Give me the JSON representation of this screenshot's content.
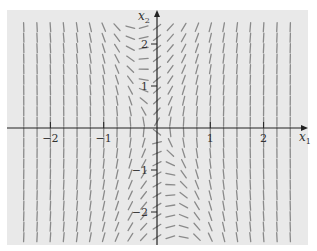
{
  "chart_data": {
    "type": "slope-field",
    "title": "",
    "xlabel": "x1",
    "ylabel": "x2",
    "xlim": [
      -2.85,
      2.8
    ],
    "ylim": [
      -2.8,
      2.8
    ],
    "x_ticks": [
      {
        "value": -2,
        "label": "−2"
      },
      {
        "value": -1,
        "label": "−1"
      },
      {
        "value": 1,
        "label": "1"
      },
      {
        "value": 2,
        "label": "2"
      }
    ],
    "y_ticks": [
      {
        "value": 2,
        "label": "2"
      },
      {
        "value": 1,
        "label": "1"
      },
      {
        "value": -1,
        "label": "−1"
      },
      {
        "value": -2,
        "label": "−2"
      }
    ],
    "grid_spacing": 0.25,
    "grid_x_range": [
      -2.5,
      2.5
    ],
    "grid_y_range": [
      -2.6,
      2.6
    ],
    "slope_formula": "(x1^3 + x1 + 0.186*x2) / (0.213*x2)",
    "slope_params": {
      "a": 0.186,
      "b": 0.213
    },
    "segment_length_px": 9,
    "grid": false,
    "legend": null
  },
  "colors": {
    "background": "#e9e9e9",
    "axis": "#222222",
    "segment": "#8a8a8a",
    "text": "#333333"
  },
  "pixel_mapping": {
    "origin_x": 157,
    "origin_y": 128,
    "px_per_unit_x": 53.3,
    "px_per_unit_y": 42,
    "plot_left": 7,
    "plot_top": 10,
    "plot_right": 308,
    "plot_bottom": 245
  }
}
